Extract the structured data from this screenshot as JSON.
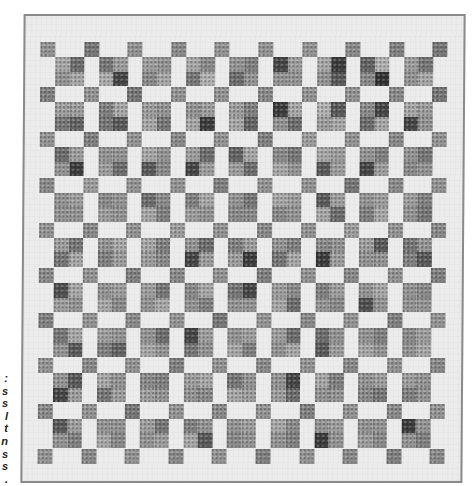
{
  "caption": {
    "line_endings": [
      ":",
      "s",
      "s",
      "l",
      "t",
      "n",
      "s",
      "s",
      "."
    ]
  },
  "quilt": {
    "description": "Grayscale photograph of a checkerboard / Irish-chain style quilt with single corner squares and four-patch blocks on a white background",
    "colors": {
      "background": "#ececec",
      "border": "#8a8a8a",
      "page": "#ffffff"
    },
    "grid": {
      "corner_rows": 10,
      "corner_cols": 10,
      "fourpatch_rows": 9,
      "fourpatch_cols": 9,
      "origin_x": 15,
      "origin_y": 26,
      "pitch_x": 43.6,
      "pitch_y": 45.2,
      "corner_size": 15,
      "sub_size": 14.5
    },
    "corner_tones": [
      [
        150,
        120,
        150,
        140,
        150,
        150,
        150,
        140,
        130,
        120
      ],
      [
        130,
        150,
        120,
        150,
        150,
        140,
        150,
        150,
        140,
        120
      ],
      [
        150,
        130,
        150,
        140,
        150,
        130,
        160,
        150,
        140,
        150
      ],
      [
        140,
        160,
        150,
        150,
        130,
        150,
        150,
        120,
        140,
        150
      ],
      [
        150,
        140,
        150,
        160,
        150,
        140,
        150,
        160,
        150,
        140
      ],
      [
        140,
        150,
        130,
        140,
        150,
        130,
        150,
        140,
        150,
        130
      ],
      [
        130,
        150,
        140,
        150,
        120,
        150,
        140,
        150,
        130,
        150
      ],
      [
        150,
        140,
        150,
        130,
        150,
        140,
        150,
        140,
        150,
        140
      ],
      [
        140,
        150,
        120,
        150,
        140,
        150,
        130,
        150,
        140,
        150
      ],
      [
        150,
        140,
        150,
        140,
        150,
        130,
        150,
        140,
        130,
        140
      ]
    ],
    "fourpatch_tones": [
      [
        [
          170,
          110,
          150,
          170
        ],
        [
          120,
          160,
          175,
          70
        ],
        [
          160,
          150,
          140,
          170
        ],
        [
          170,
          140,
          120,
          180
        ],
        [
          150,
          130,
          110,
          150
        ],
        [
          70,
          160,
          150,
          150
        ],
        [
          170,
          60,
          150,
          90
        ],
        [
          100,
          180,
          140,
          50
        ],
        [
          160,
          120,
          150,
          170
        ]
      ],
      [
        [
          160,
          160,
          120,
          100
        ],
        [
          130,
          170,
          120,
          90
        ],
        [
          160,
          150,
          170,
          120
        ],
        [
          150,
          160,
          170,
          60
        ],
        [
          160,
          130,
          170,
          100
        ],
        [
          60,
          170,
          150,
          110
        ],
        [
          180,
          90,
          160,
          170
        ],
        [
          140,
          70,
          110,
          170
        ],
        [
          170,
          160,
          70,
          150
        ]
      ],
      [
        [
          110,
          160,
          150,
          60
        ],
        [
          150,
          150,
          160,
          110
        ],
        [
          170,
          150,
          90,
          140
        ],
        [
          160,
          110,
          70,
          160
        ],
        [
          100,
          170,
          160,
          110
        ],
        [
          140,
          120,
          170,
          150
        ],
        [
          170,
          160,
          90,
          160
        ],
        [
          150,
          130,
          70,
          160
        ],
        [
          150,
          120,
          140,
          150
        ]
      ],
      [
        [
          150,
          160,
          150,
          150
        ],
        [
          140,
          150,
          160,
          150
        ],
        [
          110,
          140,
          170,
          130
        ],
        [
          130,
          170,
          160,
          150
        ],
        [
          150,
          120,
          140,
          140
        ],
        [
          170,
          160,
          140,
          150
        ],
        [
          90,
          160,
          170,
          110
        ],
        [
          150,
          160,
          130,
          170
        ],
        [
          160,
          130,
          150,
          120
        ]
      ],
      [
        [
          160,
          120,
          120,
          170
        ],
        [
          150,
          170,
          130,
          160
        ],
        [
          170,
          130,
          160,
          140
        ],
        [
          150,
          110,
          70,
          160
        ],
        [
          130,
          160,
          160,
          60
        ],
        [
          150,
          130,
          120,
          170
        ],
        [
          140,
          150,
          60,
          160
        ],
        [
          160,
          90,
          150,
          150
        ],
        [
          120,
          150,
          130,
          90
        ]
      ],
      [
        [
          80,
          170,
          160,
          150
        ],
        [
          150,
          160,
          170,
          140
        ],
        [
          160,
          120,
          150,
          170
        ],
        [
          140,
          170,
          150,
          130
        ],
        [
          120,
          70,
          150,
          150
        ],
        [
          160,
          140,
          170,
          110
        ],
        [
          130,
          160,
          150,
          140
        ],
        [
          150,
          170,
          80,
          150
        ],
        [
          150,
          140,
          150,
          150
        ]
      ],
      [
        [
          120,
          170,
          150,
          90
        ],
        [
          160,
          150,
          130,
          100
        ],
        [
          150,
          110,
          170,
          150
        ],
        [
          70,
          160,
          120,
          150
        ],
        [
          150,
          160,
          170,
          130
        ],
        [
          160,
          110,
          150,
          170
        ],
        [
          110,
          150,
          90,
          160
        ],
        [
          150,
          130,
          170,
          150
        ],
        [
          140,
          160,
          150,
          170
        ]
      ],
      [
        [
          150,
          90,
          70,
          160
        ],
        [
          170,
          150,
          120,
          160
        ],
        [
          140,
          130,
          160,
          150
        ],
        [
          160,
          170,
          150,
          140
        ],
        [
          120,
          150,
          170,
          160
        ],
        [
          150,
          70,
          160,
          110
        ],
        [
          170,
          130,
          150,
          150
        ],
        [
          150,
          160,
          140,
          120
        ],
        [
          160,
          150,
          130,
          150
        ]
      ],
      [
        [
          90,
          160,
          150,
          130
        ],
        [
          150,
          150,
          170,
          140
        ],
        [
          160,
          120,
          150,
          160
        ],
        [
          130,
          150,
          170,
          90
        ],
        [
          150,
          160,
          140,
          150
        ],
        [
          170,
          140,
          150,
          130
        ],
        [
          150,
          160,
          60,
          150
        ],
        [
          150,
          150,
          160,
          140
        ],
        [
          60,
          150,
          150,
          130
        ]
      ]
    ]
  }
}
